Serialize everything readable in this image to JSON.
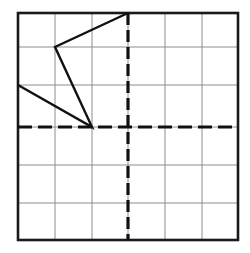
{
  "figure": {
    "canvas": {
      "width": 250,
      "height": 253
    },
    "colors": {
      "background": "#ffffff",
      "border": "#1a1a1a",
      "gridline": "#8c8c8c",
      "axis": "#111111",
      "shape": "#111111"
    },
    "grid": {
      "columns": 6,
      "rows": 6,
      "x_positions": [
        18,
        55,
        92,
        128,
        165,
        202,
        238
      ],
      "y_positions": [
        13,
        47,
        85,
        127,
        165,
        203,
        240
      ],
      "border_width": 2.6,
      "gridline_width": 1.0
    },
    "axes": {
      "origin": {
        "x": 128,
        "y": 127
      },
      "x_axis": {
        "y": 127,
        "x_start": 18,
        "x_end": 238,
        "style": "dashed",
        "dash": "14 6",
        "width": 3.2
      },
      "y_axis": {
        "x": 128,
        "y_start": 13,
        "y_end": 240,
        "style": "dashed",
        "dash": "12 5",
        "width": 3.2
      }
    },
    "shape": {
      "name": "open-polyline",
      "closed": false,
      "stroke_width": 2.4,
      "vertices": [
        {
          "label": "top-vertex",
          "x": 128,
          "y": 13
        },
        {
          "label": "upper-left-vertex",
          "x": 55,
          "y": 47
        },
        {
          "label": "bottom-vertex",
          "x": 92,
          "y": 127
        },
        {
          "label": "left-edge-vertex",
          "x": 18,
          "y": 85
        }
      ],
      "segments": [
        {
          "name": "segment-top-to-upperleft",
          "from": 0,
          "to": 1
        },
        {
          "name": "segment-upperleft-to-bottom",
          "from": 1,
          "to": 2
        },
        {
          "name": "segment-bottom-to-leftedge",
          "from": 2,
          "to": 3
        }
      ]
    }
  }
}
